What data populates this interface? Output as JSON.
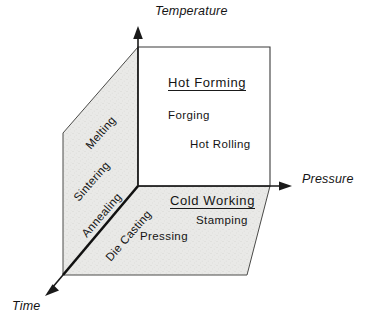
{
  "figure": {
    "kind": "3d-axes-process-map",
    "background_color": "#ffffff",
    "ink_color": "#1a1a1a",
    "shaded_plane_color": "#e8e8e6"
  },
  "axes": [
    {
      "id": "temperature",
      "label": "Temperature",
      "direction": "up"
    },
    {
      "id": "pressure",
      "label": "Pressure",
      "direction": "right"
    },
    {
      "id": "time",
      "label": "Time",
      "direction": "down-left"
    }
  ],
  "regions": {
    "hot_forming": {
      "title": "Hot Forming",
      "items": [
        {
          "label": "Forging"
        },
        {
          "label": "Hot Rolling"
        }
      ]
    },
    "cold_working": {
      "title": "Cold Working",
      "items": [
        {
          "label": "Stamping"
        },
        {
          "label": "Pressing"
        }
      ]
    },
    "time_plane": {
      "items": [
        {
          "label": "Melting"
        },
        {
          "label": "Sintering"
        },
        {
          "label": "Annealing"
        },
        {
          "label": "Die Casting"
        }
      ]
    }
  }
}
